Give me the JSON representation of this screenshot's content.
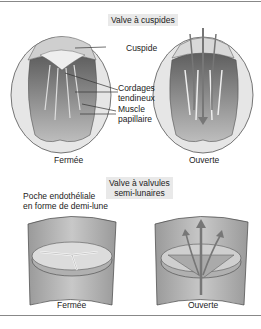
{
  "top_section": {
    "title": "Valve à cuspides",
    "labels": {
      "cuspide": "Cuspide",
      "cordages_line1": "Cordages",
      "cordages_line2": "tendineux",
      "muscle_line1": "Muscle",
      "muscle_line2": "papillaire"
    },
    "captions": {
      "closed": "Fermée",
      "open": "Ouverte"
    }
  },
  "bottom_section": {
    "title_line1": "Valve à valvules",
    "title_line2": "semi-lunaires",
    "pocket_line1": "Poche endothéliale",
    "pocket_line2": "en forme de demi-lune",
    "captions": {
      "closed": "Fermée",
      "open": "Ouverte"
    }
  },
  "colors": {
    "title_bg": "#e9e9e9",
    "tissue_light": "#d9d9d9",
    "tissue_mid": "#a8a8a8",
    "tissue_dark": "#6e6e6e",
    "arrow": "#7a7a7a"
  }
}
